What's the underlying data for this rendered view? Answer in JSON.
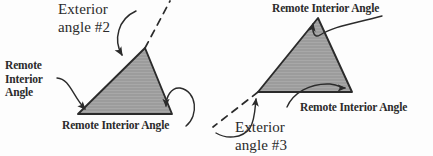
{
  "figure": {
    "type": "geometry-diagram",
    "background_color": "#fdfdfd",
    "ink_color": "#2b2b2b",
    "triangle_fill_color": "#9a9a9a",
    "triangle_stroke_color": "#2b2b2b"
  },
  "left_figure": {
    "exterior_label_line1": "Exterior",
    "exterior_label_line2": "angle #2",
    "remote_left_line1": "Remote",
    "remote_left_line2": "Interior",
    "remote_left_line3": "Angle",
    "remote_bottom_label": "Remote Interior Angle",
    "triangle_vertices": [
      [
        145,
        48
      ],
      [
        78,
        114
      ],
      [
        172,
        114
      ]
    ],
    "extension_ray_dashed": [
      [
        145,
        48
      ],
      [
        170,
        2
      ]
    ]
  },
  "right_figure": {
    "remote_top_label": "Remote Interior Angle",
    "remote_bottom_label": "Remote Interior Angle",
    "exterior_label_line1": "Exterior",
    "exterior_label_line2": "angle #3",
    "triangle_vertices": [
      [
        318,
        18
      ],
      [
        258,
        92
      ],
      [
        352,
        92
      ]
    ],
    "extension_ray_dashed": [
      [
        258,
        92
      ],
      [
        214,
        126
      ]
    ]
  }
}
